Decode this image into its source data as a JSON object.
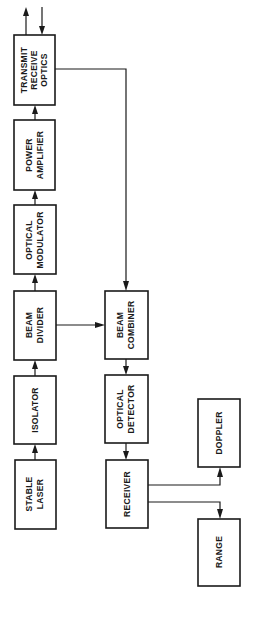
{
  "diagram": {
    "orientation": "rotated-90-ccw",
    "colors": {
      "stroke": "#1a1a1a",
      "background": "#ffffff"
    },
    "blocks": {
      "transmit_receive_optics": {
        "line1": "TRANSMIT",
        "line2": "RECEIVE",
        "line3": "OPTICS"
      },
      "power_amplifier": {
        "line1": "POWER",
        "line2": "AMPLIFIER"
      },
      "optical_modulator": {
        "line1": "OPTICAL",
        "line2": "MODULATOR"
      },
      "beam_divider": {
        "line1": "BEAM",
        "line2": "DIVIDER"
      },
      "isolator": {
        "line1": "ISOLATOR"
      },
      "stable_laser": {
        "line1": "STABLE",
        "line2": "LASER"
      },
      "beam_combiner": {
        "line1": "BEAM",
        "line2": "COMBINER"
      },
      "optical_detector": {
        "line1": "OPTICAL",
        "line2": "DETECTOR"
      },
      "receiver": {
        "line1": "RECEIVER"
      },
      "doppler": {
        "line1": "DOPPLER"
      },
      "range": {
        "line1": "RANGE"
      }
    },
    "connections": [
      {
        "from": "stable_laser",
        "to": "isolator"
      },
      {
        "from": "isolator",
        "to": "beam_divider"
      },
      {
        "from": "beam_divider",
        "to": "optical_modulator"
      },
      {
        "from": "optical_modulator",
        "to": "power_amplifier"
      },
      {
        "from": "power_amplifier",
        "to": "transmit_receive_optics"
      },
      {
        "from": "transmit_receive_optics",
        "to": "output_beam"
      },
      {
        "from": "return_beam",
        "to": "transmit_receive_optics"
      },
      {
        "from": "transmit_receive_optics",
        "to": "beam_combiner"
      },
      {
        "from": "beam_divider",
        "to": "beam_combiner"
      },
      {
        "from": "beam_combiner",
        "to": "optical_detector"
      },
      {
        "from": "optical_detector",
        "to": "receiver"
      },
      {
        "from": "receiver",
        "to": "doppler"
      },
      {
        "from": "receiver",
        "to": "range"
      }
    ]
  }
}
